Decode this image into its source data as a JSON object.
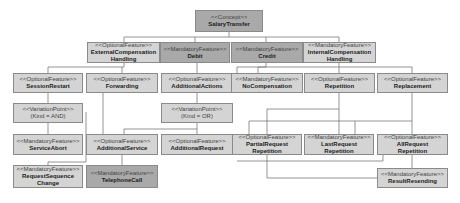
{
  "diagram": {
    "nodes": {
      "salary_transfer": {
        "stereotype": "<<Concept>>",
        "name": "SalaryTransfer"
      },
      "external_comp": {
        "stereotype": "<<OptionalFeature>>",
        "name": "ExternalCompensation",
        "name2": "Handling"
      },
      "debit": {
        "stereotype": "<<MandatoryFeature>>",
        "name": "Debit"
      },
      "credit": {
        "stereotype": "<<MandatoryFeature>>",
        "name": "Credit"
      },
      "internal_comp": {
        "stereotype": "<<MandatoryFeature>>",
        "name": "InternalCompensation",
        "name2": "Handling"
      },
      "session_restart": {
        "stereotype": "<<OptionalFeature>>",
        "name": "SessionRestart"
      },
      "forwarding": {
        "stereotype": "<<OptionalFeature>>",
        "name": "Forwarding"
      },
      "additional_actions": {
        "stereotype": "<<OptionalFeature>>",
        "name": "AdditionalActions"
      },
      "no_compensation": {
        "stereotype": "<<MandatoryFeature>>",
        "name": "NoCompensation"
      },
      "repetition": {
        "stereotype": "<<OptionalFeature>>",
        "name": "Repetition"
      },
      "replacement": {
        "stereotype": "<<OptionalFeature>>",
        "name": "Replacement"
      },
      "vp_and": {
        "stereotype": "<<VariationPoint>>",
        "name": "(Kind = AND)"
      },
      "vp_or": {
        "stereotype": "<<VariationPoint>>",
        "name": "(Kind = OR)"
      },
      "service_abort": {
        "stereotype": "<<MandatoryFeature>>",
        "name": "ServiceAbort"
      },
      "additional_service": {
        "stereotype": "<<OptionalFeature>>",
        "name": "AdditionalService"
      },
      "additional_request": {
        "stereotype": "<<OptionalFeature>>",
        "name": "AdditionalRequest"
      },
      "partial_request": {
        "stereotype": "<<OptionalFeature>>",
        "name": "PartialRequest",
        "name2": "Repetition"
      },
      "last_request": {
        "stereotype": "<<MandatoryFeature>>",
        "name": "LastRequest",
        "name2": "Repetition"
      },
      "all_request": {
        "stereotype": "<<OptionalFeature>>",
        "name": "AllRequest",
        "name2": "Repetition"
      },
      "request_sequence": {
        "stereotype": "<<MandatoryFeature>>",
        "name": "RequestSequence",
        "name2": "Change"
      },
      "telephone_call": {
        "stereotype": "<<MandatoryFeature>>",
        "name": "TelephoneCall"
      },
      "result_resending": {
        "stereotype": "<<MandatoryFeature>>",
        "name": "ResultResending"
      }
    },
    "colors": {
      "box": "#d4d4d4",
      "box_dark": "#a9a9a9",
      "border": "#8a8a8a",
      "line": "#7a7a7a"
    }
  }
}
